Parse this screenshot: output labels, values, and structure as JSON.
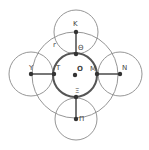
{
  "diagram": {
    "center": {
      "label": "O",
      "x": 75,
      "y": 75
    },
    "big_circle": {
      "r": 43,
      "label": "r",
      "label_x": 53,
      "label_y": 47
    },
    "inner_circle": {
      "r": 22
    },
    "points": [
      {
        "id": "K",
        "label": "K",
        "x": 76,
        "y": 32,
        "lx": 73,
        "ly": 26
      },
      {
        "id": "Theta",
        "label": "Θ",
        "x": 76,
        "y": 54,
        "lx": 78,
        "ly": 50
      },
      {
        "id": "Y",
        "label": "Y",
        "x": 31,
        "y": 74,
        "lx": 29,
        "ly": 70
      },
      {
        "id": "T",
        "label": "T",
        "x": 54,
        "y": 74,
        "lx": 56,
        "ly": 70
      },
      {
        "id": "M",
        "label": "M",
        "x": 97,
        "y": 74,
        "lx": 90,
        "ly": 71
      },
      {
        "id": "N",
        "label": "N",
        "x": 120,
        "y": 74,
        "lx": 122,
        "ly": 70
      },
      {
        "id": "Xi",
        "label": "Ξ",
        "x": 76,
        "y": 97,
        "lx": 75,
        "ly": 93
      },
      {
        "id": "Pi",
        "label": "Π",
        "x": 76,
        "y": 119,
        "lx": 79,
        "ly": 121
      }
    ],
    "outer_circles": [
      {
        "cx": 76,
        "cy": 32,
        "r": 22
      },
      {
        "cx": 31,
        "cy": 74,
        "r": 22
      },
      {
        "cx": 120,
        "cy": 74,
        "r": 22
      },
      {
        "cx": 76,
        "cy": 119,
        "r": 21
      }
    ],
    "segments": [
      {
        "from": "K",
        "to": "Theta"
      },
      {
        "from": "Y",
        "to": "T"
      },
      {
        "from": "M",
        "to": "N"
      },
      {
        "from": "Xi",
        "to": "Pi"
      }
    ],
    "colors": {
      "thin": "#8a8a8a",
      "bold": "#555555",
      "point": "#333333"
    }
  }
}
